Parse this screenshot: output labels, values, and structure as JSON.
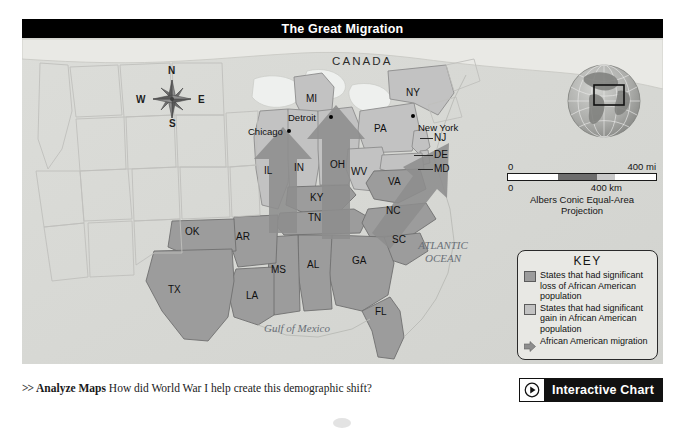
{
  "figure": {
    "title": "The Great Migration",
    "country_label": "CANADA",
    "water_labels": [
      {
        "name": "atlantic-ocean",
        "line1": "ATLANTIC",
        "line2": "OCEAN"
      },
      {
        "name": "gulf-of-mexico",
        "line1": "Gulf of Mexico",
        "line2": ""
      }
    ],
    "cities": [
      {
        "name": "Chicago",
        "label": "Chicago"
      },
      {
        "name": "Detroit",
        "label": "Detroit"
      },
      {
        "name": "New York",
        "label": "New York"
      }
    ],
    "states": [
      {
        "code": "MI"
      },
      {
        "code": "NY"
      },
      {
        "code": "PA"
      },
      {
        "code": "OH"
      },
      {
        "code": "IN"
      },
      {
        "code": "IL"
      },
      {
        "code": "WV"
      },
      {
        "code": "VA"
      },
      {
        "code": "KY"
      },
      {
        "code": "TN"
      },
      {
        "code": "NC"
      },
      {
        "code": "SC"
      },
      {
        "code": "GA"
      },
      {
        "code": "AL"
      },
      {
        "code": "MS"
      },
      {
        "code": "AR"
      },
      {
        "code": "LA"
      },
      {
        "code": "TX"
      },
      {
        "code": "OK"
      },
      {
        "code": "FL"
      },
      {
        "code": "NJ"
      },
      {
        "code": "DE"
      },
      {
        "code": "MD"
      }
    ],
    "compass": {
      "north": "N",
      "east": "E",
      "south": "S",
      "west": "W"
    },
    "scale": {
      "miles_start": "0",
      "miles_end": "400 mi",
      "km_start": "0",
      "km_end": "400 km",
      "projection_line1": "Albers Conic Equal-Area",
      "projection_line2": "Projection"
    },
    "key": {
      "title": "KEY",
      "entries": [
        {
          "swatch": "loss",
          "text": "States that had significant loss of African American population"
        },
        {
          "swatch": "gain",
          "text": "States that had significant gain in African American population"
        },
        {
          "swatch": "arrow",
          "text": "African American migration"
        }
      ]
    },
    "colors": {
      "loss_fill": "#9c9c9c",
      "gain_fill": "#c2c2c2",
      "arrow_fill": "#8d8d8d",
      "land_base": "#e4e4e0",
      "water": "#d9dad6",
      "title_bar": "#000000"
    }
  },
  "bottom": {
    "chevron": ">>",
    "lead": "Analyze Maps",
    "question": "How did World War I help create this demographic shift?",
    "interactive_label": "Interactive Chart"
  }
}
